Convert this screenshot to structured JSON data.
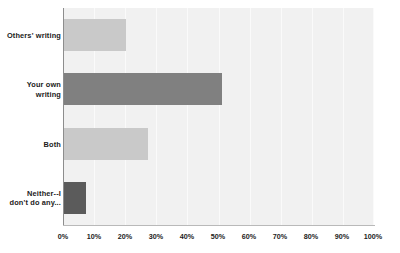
{
  "chart_data": {
    "type": "bar",
    "orientation": "horizontal",
    "title": "",
    "xlabel": "",
    "ylabel": "",
    "categories": [
      "Others' writing",
      "Your own writing",
      "Both",
      "Neither--I don't do any..."
    ],
    "values": [
      20,
      51,
      27,
      7
    ],
    "value_unit": "%",
    "bar_colors": [
      "#c9c9c9",
      "#808080",
      "#c9c9c9",
      "#5b5b5b"
    ],
    "xlim": [
      0,
      100
    ],
    "xticks": [
      0,
      10,
      20,
      30,
      40,
      50,
      60,
      70,
      80,
      90,
      100
    ],
    "xtick_labels": [
      "0%",
      "10%",
      "20%",
      "30%",
      "40%",
      "50%",
      "60%",
      "70%",
      "80%",
      "90%",
      "100%"
    ],
    "grid": true,
    "grid_axis": "x",
    "legend": null,
    "legend_position": "none",
    "plot_background": "#f1f1f1",
    "series": [
      {
        "name": "Response share",
        "values": [
          20,
          51,
          27,
          7
        ]
      }
    ]
  },
  "labels": {
    "category_1_line_1": "Others' writing",
    "category_2_line_1": "Your own",
    "category_2_line_2": "writing",
    "category_3_line_1": "Both",
    "category_4_line_1": "Neither--I",
    "category_4_line_2": "don't do any..."
  }
}
